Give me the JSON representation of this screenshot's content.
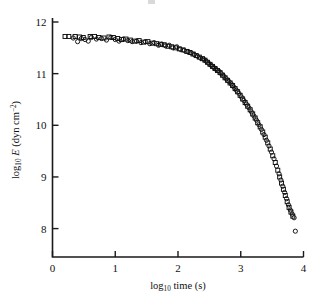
{
  "figure": {
    "background_color": "#ffffff",
    "ink_color": "#0d0d0d"
  },
  "chart_data": {
    "type": "scatter",
    "title": "",
    "xlabel": "log10 time (s)",
    "ylabel": "log10 E (dyn cm-2)",
    "xlabel_parts": {
      "base": "log",
      "sub": "10",
      "rest": " time (s)"
    },
    "ylabel_parts": {
      "base": "log",
      "sub": "10",
      "symbol": "E",
      "units": " (dyn cm",
      "sup": "−2",
      "close": ")"
    },
    "xlim": [
      0,
      4
    ],
    "ylim": [
      7.45,
      12.0
    ],
    "xticks": [
      0,
      1,
      2,
      3,
      4
    ],
    "yticks": [
      8,
      9,
      10,
      11,
      12
    ],
    "xticklabels": [
      "0",
      "1",
      "2",
      "3",
      "4"
    ],
    "yticklabels": [
      "8",
      "9",
      "10",
      "11",
      "12"
    ],
    "grid": false,
    "legend": "none",
    "axis_style": "left-and-bottom-spines-ticks-inward",
    "series": [
      {
        "name": "circles",
        "marker": "open-circle",
        "points": [
          [
            0.33,
            11.69
          ],
          [
            0.4,
            11.62
          ],
          [
            0.46,
            11.68
          ],
          [
            0.52,
            11.66
          ],
          [
            0.57,
            11.63
          ],
          [
            0.62,
            11.7
          ],
          [
            0.7,
            11.67
          ],
          [
            0.78,
            11.68
          ],
          [
            0.86,
            11.65
          ],
          [
            0.93,
            11.7
          ],
          [
            1.0,
            11.66
          ],
          [
            1.06,
            11.63
          ],
          [
            1.13,
            11.67
          ],
          [
            1.2,
            11.64
          ],
          [
            1.27,
            11.62
          ],
          [
            1.34,
            11.63
          ],
          [
            1.41,
            11.6
          ],
          [
            1.48,
            11.62
          ],
          [
            1.55,
            11.58
          ],
          [
            1.62,
            11.6
          ],
          [
            1.69,
            11.55
          ],
          [
            1.74,
            11.57
          ],
          [
            1.8,
            11.54
          ],
          [
            1.86,
            11.55
          ],
          [
            1.92,
            11.5
          ],
          [
            1.98,
            11.52
          ],
          [
            2.04,
            11.47
          ],
          [
            2.1,
            11.45
          ],
          [
            2.16,
            11.43
          ],
          [
            2.21,
            11.4
          ],
          [
            2.26,
            11.37
          ],
          [
            2.31,
            11.34
          ],
          [
            2.36,
            11.3
          ],
          [
            2.41,
            11.28
          ],
          [
            2.45,
            11.24
          ],
          [
            2.49,
            11.2
          ],
          [
            2.53,
            11.16
          ],
          [
            2.57,
            11.12
          ],
          [
            2.61,
            11.08
          ],
          [
            2.65,
            11.05
          ],
          [
            2.69,
            11.0
          ],
          [
            2.73,
            10.95
          ],
          [
            2.77,
            10.9
          ],
          [
            2.81,
            10.85
          ],
          [
            2.85,
            10.8
          ],
          [
            2.89,
            10.74
          ],
          [
            2.93,
            10.68
          ],
          [
            2.97,
            10.62
          ],
          [
            3.01,
            10.55
          ],
          [
            3.05,
            10.48
          ],
          [
            3.09,
            10.41
          ],
          [
            3.13,
            10.34
          ],
          [
            3.17,
            10.26
          ],
          [
            3.21,
            10.18
          ],
          [
            3.25,
            10.1
          ],
          [
            3.29,
            10.01
          ],
          [
            3.33,
            9.92
          ],
          [
            3.37,
            9.82
          ],
          [
            3.41,
            9.71
          ],
          [
            3.45,
            9.6
          ],
          [
            3.49,
            9.48
          ],
          [
            3.53,
            9.35
          ],
          [
            3.57,
            9.21
          ],
          [
            3.61,
            9.06
          ],
          [
            3.64,
            8.94
          ],
          [
            3.67,
            8.82
          ],
          [
            3.7,
            8.7
          ],
          [
            3.73,
            8.58
          ],
          [
            3.76,
            8.46
          ],
          [
            3.79,
            8.36
          ],
          [
            3.82,
            8.28
          ],
          [
            3.85,
            8.21
          ],
          [
            3.87,
            7.95
          ]
        ]
      },
      {
        "name": "squares",
        "marker": "open-square",
        "points": [
          [
            0.2,
            11.72
          ],
          [
            0.26,
            11.72
          ],
          [
            0.36,
            11.72
          ],
          [
            0.43,
            11.71
          ],
          [
            0.49,
            11.7
          ],
          [
            0.6,
            11.72
          ],
          [
            0.67,
            11.72
          ],
          [
            0.74,
            11.7
          ],
          [
            0.82,
            11.69
          ],
          [
            0.9,
            11.71
          ],
          [
            0.97,
            11.7
          ],
          [
            1.04,
            11.68
          ],
          [
            1.1,
            11.66
          ],
          [
            1.17,
            11.67
          ],
          [
            1.24,
            11.65
          ],
          [
            1.31,
            11.63
          ],
          [
            1.38,
            11.64
          ],
          [
            1.45,
            11.61
          ],
          [
            1.52,
            11.62
          ],
          [
            1.59,
            11.59
          ],
          [
            1.66,
            11.58
          ],
          [
            1.72,
            11.57
          ],
          [
            1.78,
            11.56
          ],
          [
            1.84,
            11.53
          ],
          [
            1.9,
            11.52
          ],
          [
            1.96,
            11.5
          ],
          [
            2.02,
            11.48
          ],
          [
            2.08,
            11.46
          ],
          [
            2.14,
            11.43
          ],
          [
            2.19,
            11.41
          ],
          [
            2.24,
            11.38
          ],
          [
            2.29,
            11.35
          ],
          [
            2.34,
            11.32
          ],
          [
            2.39,
            11.29
          ],
          [
            2.43,
            11.26
          ],
          [
            2.47,
            11.22
          ],
          [
            2.51,
            11.18
          ],
          [
            2.55,
            11.14
          ],
          [
            2.59,
            11.1
          ],
          [
            2.63,
            11.06
          ],
          [
            2.67,
            11.02
          ],
          [
            2.71,
            10.97
          ],
          [
            2.75,
            10.92
          ],
          [
            2.79,
            10.87
          ],
          [
            2.83,
            10.82
          ],
          [
            2.87,
            10.77
          ],
          [
            2.91,
            10.71
          ],
          [
            2.95,
            10.65
          ],
          [
            2.99,
            10.58
          ],
          [
            3.03,
            10.51
          ],
          [
            3.07,
            10.44
          ],
          [
            3.11,
            10.37
          ],
          [
            3.15,
            10.3
          ],
          [
            3.19,
            10.22
          ],
          [
            3.23,
            10.14
          ],
          [
            3.27,
            10.05
          ],
          [
            3.31,
            9.97
          ],
          [
            3.35,
            9.87
          ],
          [
            3.39,
            9.77
          ],
          [
            3.43,
            9.66
          ],
          [
            3.47,
            9.54
          ],
          [
            3.51,
            9.41
          ],
          [
            3.55,
            9.28
          ],
          [
            3.59,
            9.13
          ],
          [
            3.62,
            9.0
          ],
          [
            3.65,
            8.88
          ],
          [
            3.68,
            8.76
          ],
          [
            3.71,
            8.64
          ],
          [
            3.74,
            8.52
          ],
          [
            3.77,
            8.41
          ],
          [
            3.8,
            8.32
          ],
          [
            3.83,
            8.24
          ]
        ]
      }
    ]
  }
}
